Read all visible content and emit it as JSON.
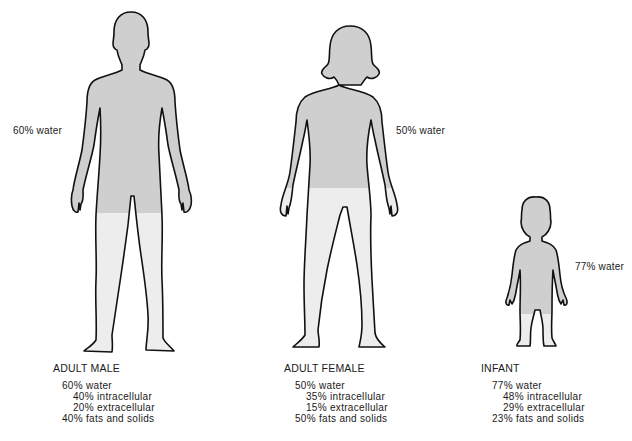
{
  "diagram": {
    "colors": {
      "water_fill": "#cfcfcf",
      "solids_fill": "#ededed",
      "outline": "#111111",
      "background": "#ffffff"
    },
    "figures": [
      {
        "id": "adult-male",
        "name": "ADULT MALE",
        "water_label": "60% water",
        "breakdown": {
          "water": "60% water",
          "intracellular": "40% intracellular",
          "extracellular": "20% extracellular",
          "fats_solids": "40% fats and solids"
        },
        "water_fraction": 0.6
      },
      {
        "id": "adult-female",
        "name": "ADULT FEMALE",
        "water_label": "50% water",
        "breakdown": {
          "water": "50% water",
          "intracellular": "35% intracellular",
          "extracellular": "15% extracellular",
          "fats_solids": "50% fats and solids"
        },
        "water_fraction": 0.5
      },
      {
        "id": "infant",
        "name": "INFANT",
        "water_label": "77% water",
        "breakdown": {
          "water": "77% water",
          "intracellular": "48% intracellular",
          "extracellular": "29% extracellular",
          "fats_solids": "23% fats and solids"
        },
        "water_fraction": 0.77
      }
    ]
  }
}
